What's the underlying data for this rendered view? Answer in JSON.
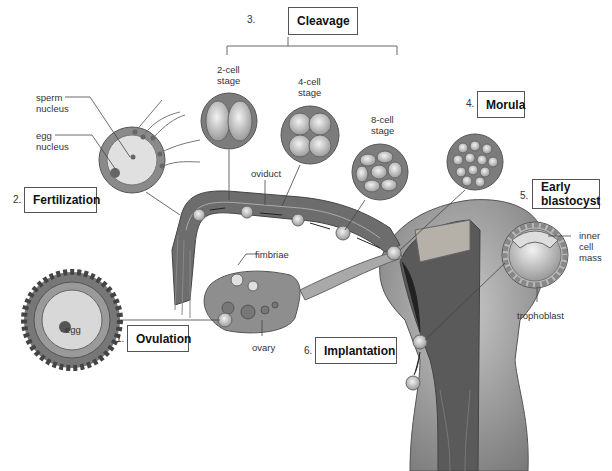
{
  "diagram": {
    "stages": [
      {
        "number": "1.",
        "label": "Ovulation"
      },
      {
        "number": "2.",
        "label": "Fertilization"
      },
      {
        "number": "3.",
        "label": "Cleavage"
      },
      {
        "number": "4.",
        "label": "Morula"
      },
      {
        "number": "5.",
        "label": "Early blastocyst",
        "label_line1": "Early",
        "label_line2": "blastocyst"
      },
      {
        "number": "6.",
        "label": "Implantation"
      }
    ],
    "labels": {
      "sperm_nucleus_1": "sperm",
      "sperm_nucleus_2": "nucleus",
      "egg_nucleus_1": "egg",
      "egg_nucleus_2": "nucleus",
      "egg": "egg",
      "two_cell_1": "2-cell",
      "two_cell_2": "stage",
      "four_cell_1": "4-cell",
      "four_cell_2": "stage",
      "eight_cell_1": "8-cell",
      "eight_cell_2": "stage",
      "oviduct": "oviduct",
      "fimbriae": "fimbriae",
      "ovary": "ovary",
      "inner_1": "inner",
      "inner_2": "cell",
      "inner_3": "mass",
      "trophoblast": "trophoblast"
    }
  }
}
